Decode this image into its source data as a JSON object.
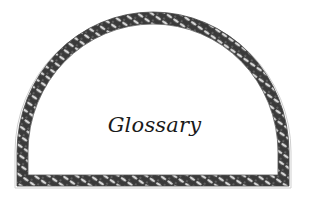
{
  "frame": {
    "shape": "semicircular-arch",
    "border_style": "decorative-leaf-garland",
    "border_color": "#2a2a2a",
    "background_color": "#ffffff"
  },
  "title": "Glossary"
}
